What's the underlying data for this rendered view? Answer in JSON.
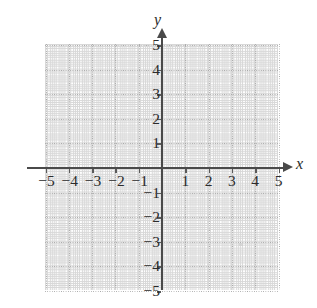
{
  "figure": {
    "name": "cartesian-coordinate-grid",
    "type": "blank-graph-paper",
    "background_color": "#ffffff",
    "axis_color": "#4a4a4a",
    "grid_color": "#b9b9b9",
    "label_color": "#2b2b2b"
  },
  "chart_data": {
    "type": "scatter",
    "title": "",
    "subtitle": "",
    "xlabel": "x",
    "ylabel": "y",
    "xlim": [
      -5,
      5
    ],
    "ylim": [
      -5,
      5
    ],
    "xticks": [
      -5,
      -4,
      -3,
      -2,
      -1,
      1,
      2,
      3,
      4,
      5
    ],
    "yticks": [
      5,
      4,
      3,
      2,
      1,
      -1,
      -2,
      -3,
      -4,
      -5
    ],
    "xtick_labels": [
      "−5",
      "−4",
      "−3",
      "−2",
      "−1",
      "1",
      "2",
      "3",
      "4",
      "5"
    ],
    "ytick_labels": [
      "5",
      "4",
      "3",
      "2",
      "1",
      "−1",
      "−2",
      "−3",
      "−4",
      "−5"
    ],
    "grid": true,
    "grid_style": "dotted",
    "grid_spacing": 1,
    "legend": null,
    "legend_position": "none",
    "series": [],
    "annotations": [],
    "x_axis_arrow": true,
    "y_axis_arrow": true,
    "origin_label": ""
  },
  "axes": {
    "x_name": "x",
    "y_name": "y",
    "x_labels_negative": [
      "−5",
      "−4",
      "−3",
      "−2",
      "−1"
    ],
    "x_labels_positive": [
      "1",
      "2",
      "3",
      "4",
      "5"
    ],
    "y_labels_positive": [
      "5",
      "4",
      "3",
      "2",
      "1"
    ],
    "y_labels_negative": [
      "−1",
      "−2",
      "−3",
      "−4",
      "−5"
    ]
  }
}
